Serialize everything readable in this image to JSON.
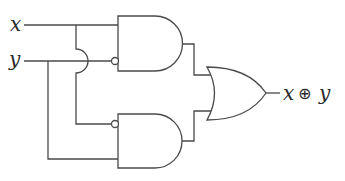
{
  "diagram": {
    "inputs": [
      {
        "label": "x"
      },
      {
        "label": "y"
      }
    ],
    "output": {
      "left": "x",
      "operator": "⊕",
      "right": "y"
    },
    "gates": [
      {
        "type": "AND",
        "name": "upper",
        "inputs": [
          "x",
          "NOT y"
        ]
      },
      {
        "type": "AND",
        "name": "lower",
        "inputs": [
          "NOT x",
          "y"
        ]
      },
      {
        "type": "OR",
        "name": "final",
        "inputs": [
          "upper",
          "lower"
        ]
      }
    ],
    "colors": {
      "stroke": "#4a4a4a",
      "text": "#2a2a2a",
      "background": "#ffffff"
    }
  }
}
